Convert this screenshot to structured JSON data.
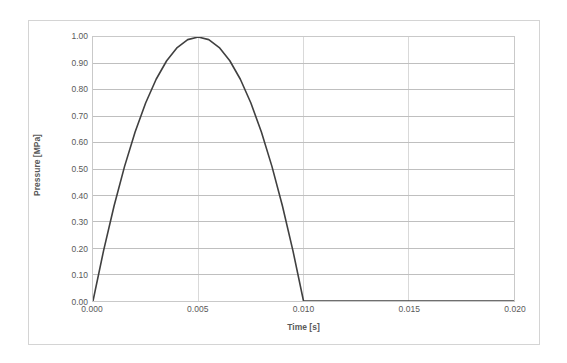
{
  "chart_data": {
    "type": "line",
    "title": "",
    "xlabel": "Time [s]",
    "ylabel": "Pressure [MPa]",
    "xlim": [
      0.0,
      0.02
    ],
    "ylim": [
      0.0,
      1.0
    ],
    "grid": true,
    "legend": false,
    "x_ticks": [
      "0.000",
      "0.005",
      "0.010",
      "0.015",
      "0.020"
    ],
    "x_tick_values": [
      0.0,
      0.005,
      0.01,
      0.015,
      0.02
    ],
    "y_ticks": [
      "0.00",
      "0.10",
      "0.20",
      "0.30",
      "0.40",
      "0.50",
      "0.60",
      "0.70",
      "0.80",
      "0.90",
      "1.00"
    ],
    "y_tick_values": [
      0.0,
      0.1,
      0.2,
      0.3,
      0.4,
      0.5,
      0.6,
      0.7,
      0.8,
      0.9,
      1.0
    ],
    "series": [
      {
        "name": "Pressure",
        "color": "#404040",
        "line_width": 1.6,
        "x": [
          0.0,
          0.0005,
          0.001,
          0.0015,
          0.002,
          0.0025,
          0.003,
          0.0035,
          0.004,
          0.0045,
          0.005,
          0.0055,
          0.006,
          0.0065,
          0.007,
          0.0075,
          0.008,
          0.0085,
          0.009,
          0.0095,
          0.01,
          0.011,
          0.012,
          0.013,
          0.014,
          0.015,
          0.016,
          0.017,
          0.018,
          0.019,
          0.02
        ],
        "y": [
          0.0,
          0.19,
          0.36,
          0.51,
          0.64,
          0.75,
          0.84,
          0.91,
          0.96,
          0.99,
          1.0,
          0.99,
          0.96,
          0.91,
          0.84,
          0.75,
          0.64,
          0.51,
          0.36,
          0.19,
          0.0,
          0.0,
          0.0,
          0.0,
          0.0,
          0.0,
          0.0,
          0.0,
          0.0,
          0.0,
          0.0
        ]
      }
    ],
    "annotations": [],
    "colors": {
      "line": "#404040",
      "grid_horizontal": "#bfbfbf",
      "grid_vertical": "#d9d9d9",
      "plot_border": "#c9c9c9",
      "frame_border": "#d4d4d4",
      "tick_text": "#595959",
      "background": "#ffffff"
    }
  }
}
